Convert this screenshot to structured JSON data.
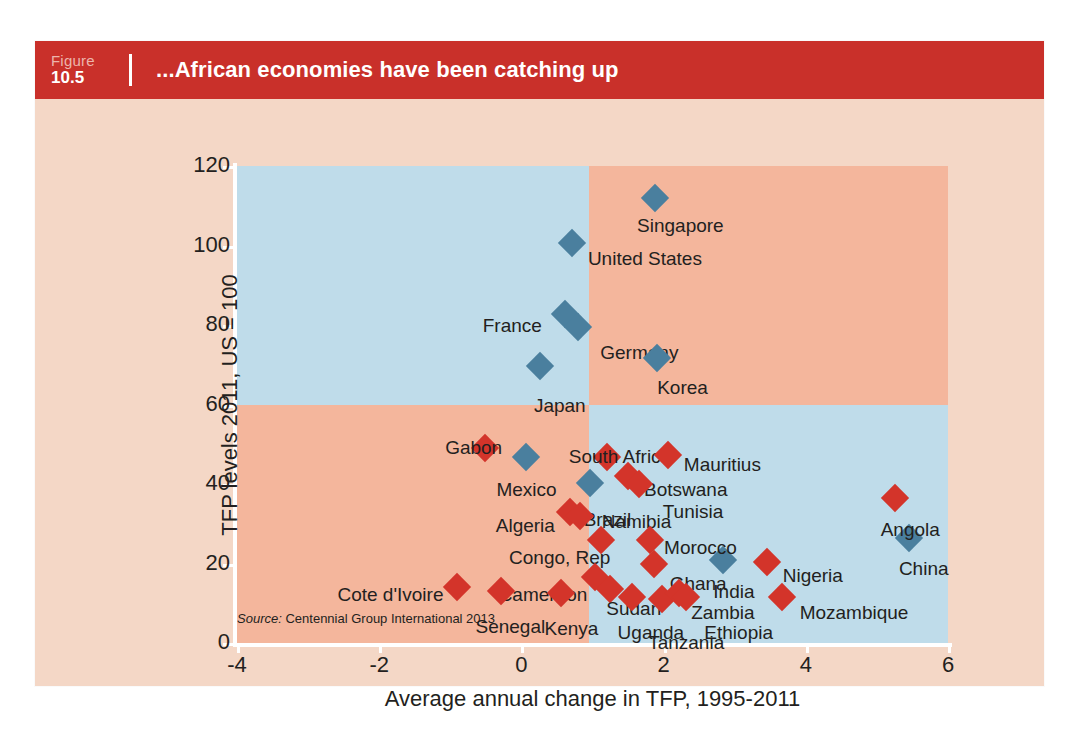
{
  "figure": {
    "label_word": "Figure",
    "number": "10.5",
    "title": "...African economies have been catching up",
    "banner_color": "#c9302a",
    "card_background": "#f4d7c6"
  },
  "source": {
    "prefix": "Source:",
    "text": "Centennial Group International 2013"
  },
  "chart_data": {
    "type": "scatter",
    "title": "...African economies have been catching up",
    "xlabel": "Average annual change in TFP, 1995-2011",
    "ylabel": "TFP levels 2011, US = 100",
    "xlim": [
      -4,
      6
    ],
    "ylim": [
      0,
      120
    ],
    "xticks": [
      -4,
      -2,
      0,
      2,
      4,
      6
    ],
    "yticks": [
      0,
      20,
      40,
      60,
      80,
      100,
      120
    ],
    "grid": false,
    "legend": "none",
    "quadrant_shading": {
      "x_divider": 0.95,
      "y_divider": 60,
      "top_left_color": "#bfdcea",
      "bottom_right_color": "#bfdcea",
      "other_color": "#f4b69c"
    },
    "series": [
      {
        "name": "Comparator economies",
        "color": "#4a7f9e",
        "marker": "diamond",
        "points": [
          {
            "label": "Singapore",
            "x": 1.88,
            "y": 112.0,
            "label_dx": -18,
            "label_dy": 18
          },
          {
            "label": "United States",
            "x": 0.71,
            "y": 100.7,
            "label_dx": 16,
            "label_dy": 6
          },
          {
            "label": "France",
            "x": 0.61,
            "y": 82.8,
            "label_dx": -82,
            "label_dy": 2
          },
          {
            "label": "Germany",
            "x": 0.8,
            "y": 79.5,
            "label_dx": 22,
            "label_dy": 16
          },
          {
            "label": "Japan",
            "x": 0.26,
            "y": 69.6,
            "label_dx": -6,
            "label_dy": 30
          },
          {
            "label": "Korea",
            "x": 1.91,
            "y": 71.6,
            "label_dx": 0,
            "label_dy": 20
          },
          {
            "label": "Mexico",
            "x": 0.07,
            "y": 46.8,
            "label_dx": -30,
            "label_dy": 23
          },
          {
            "label": "Brazil",
            "x": 0.96,
            "y": 40.3,
            "label_dx": -6,
            "label_dy": 27
          },
          {
            "label": "India",
            "x": 2.84,
            "y": 21.0,
            "label_dx": -10,
            "label_dy": 22
          },
          {
            "label": "China",
            "x": 5.45,
            "y": 26.5,
            "label_dx": -10,
            "label_dy": 21
          }
        ]
      },
      {
        "name": "African economies",
        "color": "#d3342a",
        "marker": "diamond",
        "points": [
          {
            "label": "Gabon",
            "x": -0.51,
            "y": 49.0,
            "label_dx": -40,
            "label_dy": -10
          },
          {
            "label": "South Africa",
            "x": 1.2,
            "y": 46.8,
            "label_dx": -38,
            "label_dy": -10
          },
          {
            "label": "Mauritius",
            "x": 2.06,
            "y": 47.3,
            "label_dx": 16,
            "label_dy": 0
          },
          {
            "label": "Botswana",
            "x": 1.5,
            "y": 42.0,
            "label_dx": 16,
            "label_dy": 4
          },
          {
            "label": "Tunisia",
            "x": 1.65,
            "y": 40.0,
            "label_dx": 24,
            "label_dy": 18
          },
          {
            "label": "Algeria",
            "x": 0.68,
            "y": 33.0,
            "label_dx": -74,
            "label_dy": 4
          },
          {
            "label": "Namibia",
            "x": 0.82,
            "y": 32.0,
            "label_dx": 22,
            "label_dy": -4
          },
          {
            "label": "Angola",
            "x": 5.25,
            "y": 36.5,
            "label_dx": -14,
            "label_dy": 22
          },
          {
            "label": "Morocco",
            "x": 1.81,
            "y": 26.0,
            "label_dx": 14,
            "label_dy": -2
          },
          {
            "label": "Congo, Rep",
            "x": 1.12,
            "y": 26.0,
            "label_dx": -92,
            "label_dy": 8
          },
          {
            "label": "Ghana",
            "x": 1.86,
            "y": 19.8,
            "label_dx": 16,
            "label_dy": 10
          },
          {
            "label": "Nigeria",
            "x": 3.45,
            "y": 20.5,
            "label_dx": 16,
            "label_dy": 4
          },
          {
            "label": "Cameroon",
            "x": 1.03,
            "y": 16.5,
            "label_dx": -96,
            "label_dy": 8
          },
          {
            "label": "Cote d'Ivoire",
            "x": -0.9,
            "y": 14.0,
            "label_dx": -120,
            "label_dy": -2
          },
          {
            "label": "Senegal",
            "x": -0.28,
            "y": 13.0,
            "label_dx": -26,
            "label_dy": 26
          },
          {
            "label": "Kenya",
            "x": 0.55,
            "y": 12.5,
            "label_dx": -16,
            "label_dy": 26
          },
          {
            "label": "Sudan",
            "x": 1.25,
            "y": 13.5,
            "label_dx": -4,
            "label_dy": 10
          },
          {
            "label": "Uganda",
            "x": 1.55,
            "y": 11.5,
            "label_dx": -14,
            "label_dy": 26
          },
          {
            "label": "Tanzania",
            "x": 1.98,
            "y": 11.0,
            "label_dx": -14,
            "label_dy": 34
          },
          {
            "label": "Zambia",
            "x": 2.22,
            "y": 12.5,
            "label_dx": 12,
            "label_dy": 10
          },
          {
            "label": "Ethiopia",
            "x": 2.32,
            "y": 11.5,
            "label_dx": 18,
            "label_dy": 26
          },
          {
            "label": "Mozambique",
            "x": 3.66,
            "y": 11.5,
            "label_dx": 18,
            "label_dy": 6
          }
        ]
      }
    ]
  }
}
